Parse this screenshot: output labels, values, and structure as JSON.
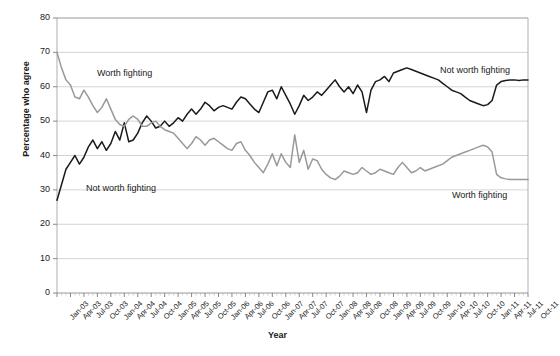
{
  "chart_data": {
    "type": "line",
    "title": "",
    "xlabel": "Year",
    "ylabel": "Percentage who agree",
    "ylim": [
      0,
      80
    ],
    "ytick_step": 10,
    "yticks": [
      "0",
      "10",
      "20",
      "30",
      "40",
      "50",
      "60",
      "70",
      "80"
    ],
    "grid": true,
    "legend_position": "inline-annotations",
    "x_tick_labels": [
      "Jan-03",
      "Apr-03",
      "Jul-03",
      "Oct-03",
      "Jan-04",
      "Apr-04",
      "Jul-04",
      "Oct-04",
      "Jan-05",
      "Apr-05",
      "Jul-05",
      "Oct-05",
      "Jan-06",
      "Apr-06",
      "Jul-06",
      "Oct-06",
      "Jan-07",
      "Apr-07",
      "Jul-07",
      "Oct-07",
      "Jan-08",
      "Apr-08",
      "Jul-08",
      "Oct-08",
      "Jan-09",
      "Apr-09",
      "Jul-09",
      "Oct-09",
      "Jan-10",
      "Apr-10",
      "Jul-10",
      "Oct-10",
      "Jan-11",
      "Apr-11",
      "Jul-11",
      "Oct-11"
    ],
    "x_range": [
      "Jan-03",
      "Oct-11"
    ],
    "series": [
      {
        "name": "Not worth fighting",
        "color": "#1a1a1a",
        "start_value": 27,
        "end_value": 62,
        "values": [
          27.0,
          31.5,
          36.0,
          38.0,
          40.0,
          37.5,
          39.5,
          42.5,
          44.5,
          42.0,
          44.0,
          41.5,
          43.5,
          47.0,
          44.5,
          49.5,
          44.0,
          44.5,
          46.5,
          49.5,
          51.5,
          50.0,
          48.0,
          48.5,
          50.0,
          48.5,
          49.5,
          51.0,
          50.0,
          52.0,
          53.5,
          52.0,
          53.5,
          55.5,
          54.5,
          53.0,
          54.0,
          54.5,
          54.0,
          53.5,
          55.5,
          57.0,
          56.5,
          55.0,
          53.5,
          52.5,
          55.5,
          58.5,
          59.0,
          56.5,
          60.0,
          57.5,
          55.0,
          52.0,
          54.5,
          57.5,
          56.0,
          57.0,
          58.5,
          57.5,
          59.0,
          60.5,
          62.0,
          60.0,
          58.5,
          60.0,
          58.0,
          60.5,
          58.5,
          52.5,
          59.0,
          61.5,
          62.0,
          63.0,
          61.5,
          64.0,
          64.5,
          65.0,
          65.5,
          65.0,
          64.5,
          64.0,
          63.5,
          63.0,
          62.5,
          62.0,
          61.0,
          60.0,
          59.0,
          58.5,
          58.0,
          57.0,
          56.0,
          55.5,
          55.0,
          54.5,
          54.8,
          56.0,
          60.5,
          61.5,
          61.8,
          62.0,
          62.0,
          61.8,
          62.0,
          62.0
        ]
      },
      {
        "name": "Worth fighting",
        "color": "#999999",
        "start_value": 70,
        "end_value": 33,
        "values": [
          70.0,
          65.5,
          62.0,
          60.5,
          57.0,
          56.5,
          59.0,
          57.0,
          54.5,
          52.5,
          54.0,
          56.5,
          53.5,
          50.5,
          49.0,
          48.5,
          50.5,
          51.5,
          50.5,
          48.5,
          48.5,
          49.5,
          50.0,
          48.5,
          47.5,
          47.0,
          46.5,
          45.0,
          43.5,
          42.0,
          43.5,
          45.5,
          44.5,
          43.0,
          44.5,
          45.0,
          44.0,
          43.0,
          42.0,
          41.5,
          43.5,
          44.0,
          41.5,
          40.0,
          38.0,
          36.5,
          35.0,
          37.5,
          40.5,
          37.0,
          40.5,
          38.0,
          36.5,
          46.0,
          38.0,
          41.5,
          36.0,
          39.0,
          38.5,
          36.0,
          34.5,
          33.5,
          33.0,
          34.0,
          35.5,
          35.0,
          34.5,
          35.0,
          36.5,
          35.5,
          34.5,
          35.0,
          36.0,
          35.5,
          35.0,
          34.5,
          36.5,
          38.0,
          36.5,
          35.0,
          35.5,
          36.5,
          35.5,
          36.0,
          36.5,
          37.0,
          37.5,
          38.5,
          39.5,
          40.0,
          40.5,
          41.0,
          41.5,
          42.0,
          42.5,
          43.0,
          42.5,
          41.0,
          34.5,
          33.5,
          33.2,
          33.0,
          33.0,
          33.0,
          33.0,
          33.0
        ]
      }
    ],
    "annotations": [
      {
        "text": "Worth fighting",
        "x": 97,
        "y": 68,
        "series": "Worth fighting"
      },
      {
        "text": "Not worth fighting",
        "x": 86,
        "y": 183,
        "series": "Not worth fighting"
      },
      {
        "text": "Not worth fighting",
        "x": 440,
        "y": 65,
        "series": "Not worth fighting"
      },
      {
        "text": "Worth fighting",
        "x": 452,
        "y": 190,
        "series": "Worth fighting"
      }
    ]
  },
  "colors": {
    "series_black": "#1a1a1a",
    "series_gray": "#999999",
    "gridline": "#c9c9c9",
    "axis": "#a6a6a6",
    "background": "#ffffff",
    "text": "#1a1a1a"
  }
}
